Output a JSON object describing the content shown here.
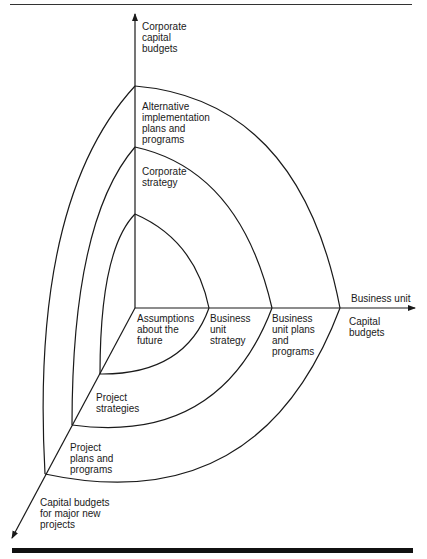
{
  "axes": {
    "vertical": {
      "label": "Corporate\ncapital\nbudgets"
    },
    "horizontal": {
      "label_above": "Business unit",
      "label_below": "Capital\nbudgets"
    },
    "diagonal": {
      "label": "Capital budgets\nfor major new\nprojects"
    }
  },
  "regions": {
    "vertical": [
      {
        "label": "Corporate\nstrategy"
      },
      {
        "label": "Alternative\nimplementation\nplans and\nprograms"
      }
    ],
    "horizontal": [
      {
        "label": "Business\nunit\nstrategy"
      },
      {
        "label": "Business\nunit plans\nand\nprograms"
      }
    ],
    "diagonal": [
      {
        "label": "Project\nstrategies"
      },
      {
        "label": "Project\nplans and\nprograms"
      }
    ],
    "center": {
      "label": "Assumptions\nabout the\nfuture"
    }
  },
  "colors": {
    "line": "#1a1a1a",
    "background": "#ffffff"
  }
}
